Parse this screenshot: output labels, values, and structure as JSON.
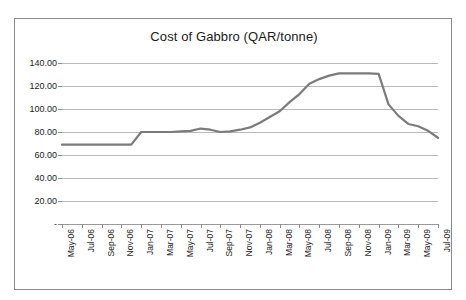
{
  "chart_data": {
    "type": "line",
    "title": "Cost of Gabbro (QAR/tonne)",
    "xlabel": "",
    "ylabel": "",
    "ylim": [
      0,
      140
    ],
    "yticks": [
      0,
      20,
      40,
      60,
      80,
      100,
      120,
      140
    ],
    "ytick_labels": [
      "-",
      "20.00",
      "40.00",
      "60.00",
      "80.00",
      "100.00",
      "120.00",
      "140.00"
    ],
    "grid": true,
    "legend": false,
    "legend_position": "none",
    "line_color": "#7b7b7b",
    "x": [
      "May-06",
      "Jun-06",
      "Jul-06",
      "Aug-06",
      "Sep-06",
      "Oct-06",
      "Nov-06",
      "Dec-06",
      "Jan-07",
      "Feb-07",
      "Mar-07",
      "Apr-07",
      "May-07",
      "Jun-07",
      "Jul-07",
      "Aug-07",
      "Sep-07",
      "Oct-07",
      "Nov-07",
      "Dec-07",
      "Jan-08",
      "Feb-08",
      "Mar-08",
      "Apr-08",
      "May-08",
      "Jun-08",
      "Jul-08",
      "Aug-08",
      "Sep-08",
      "Oct-08",
      "Nov-08",
      "Dec-08",
      "Jan-09",
      "Feb-09",
      "Mar-09",
      "Apr-09",
      "May-09",
      "Jun-09",
      "Jul-09"
    ],
    "xtick_labels": [
      "May-06",
      "Jul-06",
      "Sep-06",
      "Nov-06",
      "Jan-07",
      "Mar-07",
      "May-07",
      "Jul-07",
      "Sep-07",
      "Nov-07",
      "Jan-08",
      "Mar-08",
      "May-08",
      "Jul-08",
      "Sep-08",
      "Nov-08",
      "Jan-09",
      "Mar-09",
      "May-09",
      "Jul-09"
    ],
    "values": [
      69,
      69,
      69,
      69,
      69,
      69,
      69,
      69,
      80,
      80,
      80,
      80,
      80.5,
      81,
      83,
      82,
      80,
      80.5,
      82,
      84,
      88,
      93,
      98,
      106,
      113,
      122,
      126,
      129,
      131,
      131,
      131,
      131,
      130.5,
      104,
      94,
      87,
      85,
      81,
      75
    ],
    "series": [
      {
        "name": "Cost of Gabbro",
        "values": [
          69,
          69,
          69,
          69,
          69,
          69,
          69,
          69,
          80,
          80,
          80,
          80,
          80.5,
          81,
          83,
          82,
          80,
          80.5,
          82,
          84,
          88,
          93,
          98,
          106,
          113,
          122,
          126,
          129,
          131,
          131,
          131,
          131,
          130.5,
          104,
          94,
          87,
          85,
          81,
          75
        ]
      }
    ]
  },
  "colors": {
    "line": "#7b7b7b",
    "grid": "#b9b9b9",
    "frame": "#8a8a8a",
    "text": "#1c1c1c"
  }
}
